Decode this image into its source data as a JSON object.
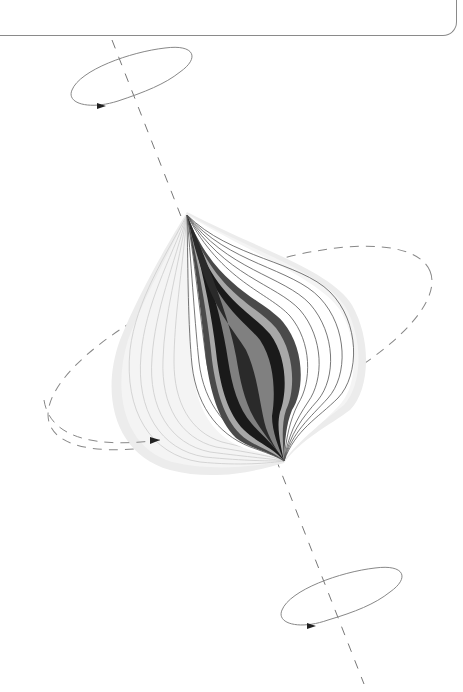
{
  "figure": {
    "type": "schematic-diagram",
    "colors": {
      "background": "#ffffff",
      "panel_border": "#8a8a8a",
      "axis_dash": "#777777",
      "ellipse_stroke": "#888888",
      "halo": "#ececec",
      "contour_line": "#555555",
      "band_dark": "#1a1a1a",
      "band_mid": "#4a4a4a",
      "band_grey": "#808080",
      "band_light": "#a8a8a8",
      "arrowhead": "#333333"
    },
    "axis": {
      "from": [
        112,
        40
      ],
      "to": [
        364,
        684
      ],
      "style": "dashed"
    },
    "apex_top": [
      187,
      215
    ],
    "apex_bottom": [
      284,
      461
    ],
    "ellipses": [
      {
        "name": "top-rotation-ellipse",
        "cx": 131,
        "cy": 76,
        "rx": 62,
        "ry": 20,
        "rotate": -25,
        "style": "solid",
        "arrow": [
          103,
          106
        ]
      },
      {
        "name": "middle-rotation-ellipse",
        "cx": 240,
        "cy": 348,
        "rx": 205,
        "ry": 72,
        "rotate": -22,
        "style": "dashed",
        "arrow": [
          155,
          440
        ]
      },
      {
        "name": "bottom-rotation-ellipse",
        "cx": 340,
        "cy": 598,
        "rx": 62,
        "ry": 20,
        "rotate": -25,
        "style": "solid",
        "arrow": [
          312,
          626
        ]
      }
    ],
    "labels": []
  }
}
